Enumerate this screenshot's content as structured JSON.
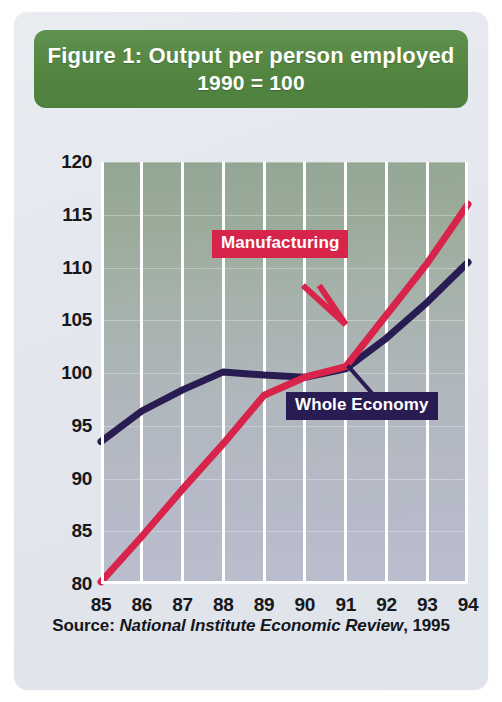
{
  "figure": {
    "title_line1": "Figure 1:  Output per person employed",
    "title_line2": "1990 = 100",
    "source_prefix": "Source:",
    "source_journal": "National Institute Economic Review",
    "source_suffix": ", 1995"
  },
  "colors": {
    "banner_green": "#53853f",
    "manufacturing": "#d8234a",
    "whole_economy": "#281c52",
    "gridline": "#ffffff",
    "card_background": "#e4e7ed"
  },
  "labels": {
    "manufacturing": "Manufacturing",
    "whole_economy": "Whole Economy"
  },
  "chart_data": {
    "type": "line",
    "subtitle": "1990 = 100",
    "xlabel": "",
    "ylabel": "",
    "x": [
      85,
      86,
      87,
      88,
      89,
      90,
      91,
      92,
      93,
      94
    ],
    "xtick_labels": [
      "85",
      "86",
      "87",
      "88",
      "89",
      "90",
      "91",
      "92",
      "93",
      "94"
    ],
    "ytick_labels": [
      "80",
      "85",
      "90",
      "95",
      "100",
      "105",
      "110",
      "115",
      "120"
    ],
    "yticks": [
      80,
      85,
      90,
      95,
      100,
      105,
      110,
      115,
      120
    ],
    "xlim": [
      85,
      94
    ],
    "ylim": [
      80,
      120
    ],
    "grid": "vertical",
    "legend": "inline-callouts",
    "series": [
      {
        "name": "Manufacturing",
        "color": "#d8234a",
        "values": [
          80.2,
          84.5,
          89.0,
          93.3,
          97.9,
          99.6,
          100.6,
          105.5,
          110.4,
          116.0
        ]
      },
      {
        "name": "Whole Economy",
        "color": "#281c52",
        "values": [
          93.5,
          96.4,
          98.4,
          100.1,
          99.8,
          99.6,
          100.4,
          103.3,
          106.7,
          110.5
        ]
      }
    ],
    "annotations": [
      {
        "text": "Manufacturing",
        "points_to_year": 91,
        "points_to_value": 104.8
      },
      {
        "text": "Whole Economy",
        "points_to_year": 91,
        "points_to_value": 100.5
      }
    ],
    "source": "Source: National Institute Economic Review, 1995"
  }
}
